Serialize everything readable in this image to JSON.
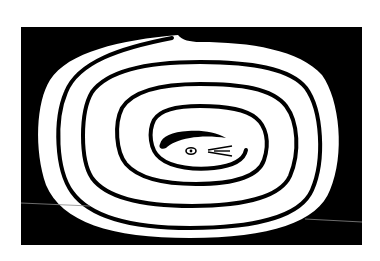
{
  "artwork": {
    "subject": "coiled snake spiral",
    "background_color": "#ffffff",
    "frame_color": "#000000",
    "body_color": "#ffffff",
    "line_color": "#000000",
    "frame": {
      "x": 21,
      "y": 27,
      "width": 341,
      "height": 218
    }
  }
}
